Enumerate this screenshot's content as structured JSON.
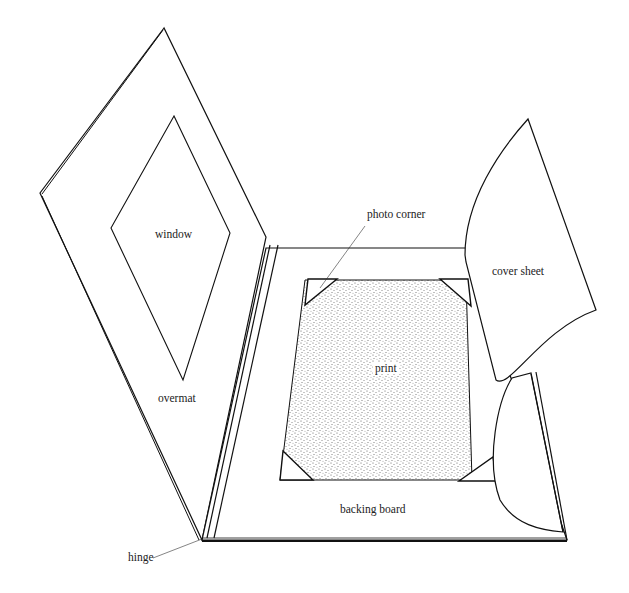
{
  "diagram": {
    "type": "illustration",
    "colors": {
      "line": "#111111",
      "stipple": "#555555",
      "background": "#ffffff",
      "text": "#222222"
    },
    "labels": {
      "window": "window",
      "overmat": "overmat",
      "hinge": "hinge",
      "photo_corner": "photo corner",
      "cover_sheet": "cover sheet",
      "print": "print",
      "backing_board": "backing board"
    }
  }
}
